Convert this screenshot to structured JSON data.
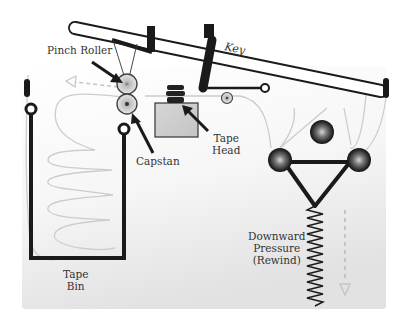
{
  "diagram": {
    "type": "tape-transport-mechanism",
    "labels": {
      "key": "Key",
      "pinch_roller": "Pinch Roller",
      "capstan": "Capstan",
      "tape_head_line1": "Tape",
      "tape_head_line2": "Head",
      "tape_bin_line1": "Tape",
      "tape_bin_line2": "Bin",
      "pressure_line1": "Downward",
      "pressure_line2": "Pressure",
      "pressure_line3": "(Rewind)"
    },
    "components": [
      "key-lever",
      "pinch-roller",
      "capstan",
      "tape-head",
      "tape-guide-roller",
      "tape-bin",
      "tension-rollers",
      "spring",
      "tape-path"
    ],
    "colors": {
      "panel_top": "#ffffff",
      "panel_bottom": "#e6e6e6",
      "ink": "#1a1a1a",
      "tape": "#cfcfcf",
      "head_body": "#d0d0d0",
      "dashed_arrow": "#c0c0c0"
    }
  }
}
